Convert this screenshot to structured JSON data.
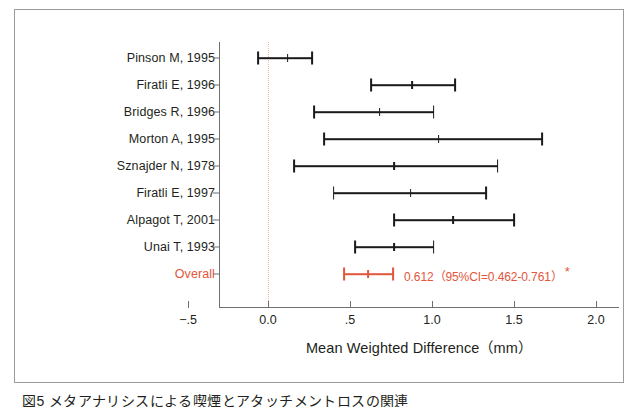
{
  "chart_data": {
    "type": "forest",
    "title": "",
    "xlabel": "Mean Weighted Difference（mm）",
    "ylabel": "",
    "xlim": [
      -0.5,
      2.0
    ],
    "xticks": [
      -0.5,
      0.0,
      0.5,
      1.0,
      1.5,
      2.0
    ],
    "xtick_labels": [
      "−.5",
      "0.0",
      ".5",
      "1.0",
      "1.5",
      "2.0"
    ],
    "grid": false,
    "legend": "none",
    "reference_line": 0.0,
    "reference_line_style": "dotted",
    "categories": [
      "Pinson M, 1995",
      "Firatli E, 1996",
      "Bridges R, 1996",
      "Morton A, 1995",
      "Sznajder N, 1978",
      "Firatli E, 1997",
      "Alpagot T, 2001",
      "Unai T, 1993",
      "Overall"
    ],
    "points": [
      {
        "label": "Pinson M, 1995",
        "estimate": 0.12,
        "ci_low": -0.06,
        "ci_high": 0.27,
        "is_overall": false
      },
      {
        "label": "Firatli E, 1996",
        "estimate": 0.88,
        "ci_low": 0.63,
        "ci_high": 1.14,
        "is_overall": false
      },
      {
        "label": "Bridges R, 1996",
        "estimate": 0.68,
        "ci_low": 0.28,
        "ci_high": 1.01,
        "is_overall": false
      },
      {
        "label": "Morton A, 1995",
        "estimate": 1.04,
        "ci_low": 0.34,
        "ci_high": 1.67,
        "is_overall": false
      },
      {
        "label": "Sznajder N, 1978",
        "estimate": 0.77,
        "ci_low": 0.16,
        "ci_high": 1.4,
        "is_overall": false
      },
      {
        "label": "Firatli E, 1997",
        "estimate": 0.87,
        "ci_low": 0.4,
        "ci_high": 1.33,
        "is_overall": false
      },
      {
        "label": "Alpagot T, 2001",
        "estimate": 1.13,
        "ci_low": 0.77,
        "ci_high": 1.5,
        "is_overall": false
      },
      {
        "label": "Unai T, 1993",
        "estimate": 0.77,
        "ci_low": 0.53,
        "ci_high": 1.01,
        "is_overall": false
      },
      {
        "label": "Overall",
        "estimate": 0.612,
        "ci_low": 0.462,
        "ci_high": 0.761,
        "is_overall": true
      }
    ],
    "overall_annotation": "0.612（95%CI=0.462-0.761）",
    "overall_significance_mark": "*"
  },
  "colors": {
    "overall": "#e2563c",
    "study": "#1a1a1a",
    "axis": "#6f6f6f",
    "reference_line": "#f0b6a5",
    "frame": "#9b9b9b"
  },
  "caption": {
    "text": "図5 メタアナリシスによる喫煙とアタッチメントロスの関連"
  }
}
